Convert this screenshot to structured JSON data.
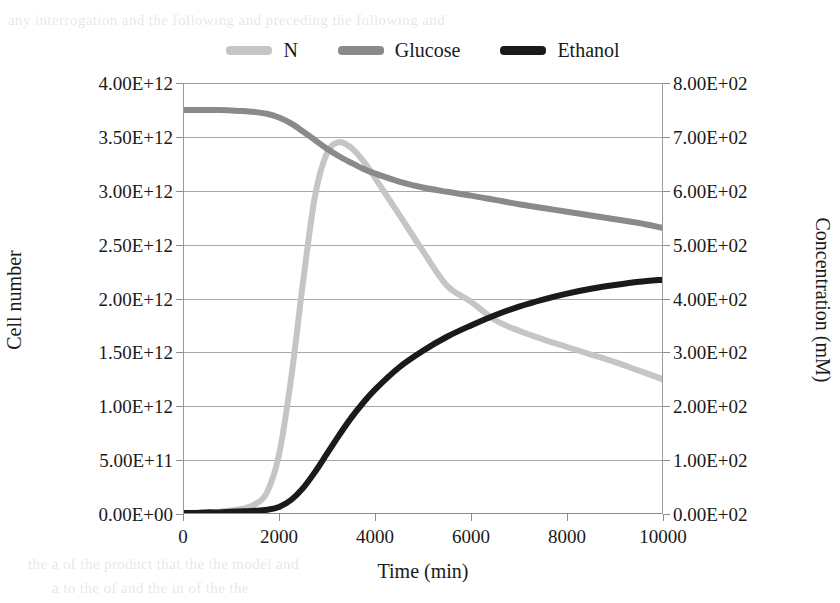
{
  "chart_data": {
    "type": "line",
    "title": "",
    "xlabel": "Time (min)",
    "ylabel": "Cell number",
    "y2label": "Concentration (mM)",
    "xlim": [
      0,
      10000
    ],
    "ylim": [
      0,
      4000000000000
    ],
    "y2lim": [
      0,
      800
    ],
    "grid": true,
    "legend_position": "top",
    "x_ticks": [
      "0",
      "2000",
      "4000",
      "6000",
      "8000",
      "10000"
    ],
    "x_tick_values": [
      0,
      2000,
      4000,
      6000,
      8000,
      10000
    ],
    "y_ticks": [
      "0.00E+00",
      "5.00E+11",
      "1.00E+12",
      "1.50E+12",
      "2.00E+12",
      "2.50E+12",
      "3.00E+12",
      "3.50E+12",
      "4.00E+12"
    ],
    "y_tick_values": [
      0,
      500000000000.0,
      1000000000000.0,
      1500000000000.0,
      2000000000000.0,
      2500000000000.0,
      3000000000000.0,
      3500000000000.0,
      4000000000000.0
    ],
    "y2_ticks": [
      "0.00E+02",
      "1.00E+02",
      "2.00E+02",
      "3.00E+02",
      "4.00E+02",
      "5.00E+02",
      "6.00E+02",
      "7.00E+02",
      "8.00E+02"
    ],
    "y2_tick_values": [
      0,
      100,
      200,
      300,
      400,
      500,
      600,
      700,
      800
    ],
    "x": [
      0,
      250,
      500,
      750,
      1000,
      1250,
      1500,
      1750,
      2000,
      2250,
      2500,
      2750,
      3000,
      3250,
      3500,
      3750,
      4000,
      4500,
      5000,
      5500,
      6000,
      6500,
      7000,
      7500,
      8000,
      8500,
      9000,
      9500,
      10000
    ],
    "series": [
      {
        "name": "N",
        "axis": "left",
        "color": "#c5c5c5",
        "units": "cells",
        "values": [
          10000000000.0,
          12000000000.0,
          16000000000.0,
          22000000000.0,
          32000000000.0,
          50000000000.0,
          90000000000.0,
          200000000000.0,
          550000000000.0,
          1250000000000.0,
          2150000000000.0,
          2950000000000.0,
          3350000000000.0,
          3450000000000.0,
          3400000000000.0,
          3280000000000.0,
          3120000000000.0,
          2780000000000.0,
          2440000000000.0,
          2120000000000.0,
          1970000000000.0,
          1800000000000.0,
          1700000000000.0,
          1620000000000.0,
          1550000000000.0,
          1480000000000.0,
          1410000000000.0,
          1330000000000.0,
          1250000000000.0
        ]
      },
      {
        "name": "Glucose",
        "axis": "right",
        "color": "#8a8a8a",
        "units": "mM",
        "values": [
          750,
          750,
          750,
          750,
          749,
          748,
          746,
          743,
          736,
          725,
          710,
          694,
          678,
          664,
          652,
          641,
          632,
          617,
          606,
          598,
          591,
          583,
          575,
          568,
          561,
          554,
          547,
          540,
          531
        ]
      },
      {
        "name": "Ethanol",
        "axis": "right",
        "color": "#1a1a1a",
        "units": "mM",
        "values": [
          2,
          2,
          3,
          3,
          4,
          5,
          6,
          8,
          13,
          26,
          48,
          78,
          112,
          146,
          178,
          206,
          231,
          272,
          303,
          329,
          350,
          369,
          385,
          398,
          409,
          418,
          425,
          431,
          435
        ]
      }
    ],
    "annotations": {
      "n_peak_time": 3250,
      "n_peak_value": 3450000000000.0,
      "glucose_initial": 750,
      "ethanol_final": 435
    }
  },
  "legend": {
    "items": [
      {
        "label": "N",
        "color": "#c5c5c5"
      },
      {
        "label": "Glucose",
        "color": "#8a8a8a"
      },
      {
        "label": "Ethanol",
        "color": "#1a1a1a"
      }
    ]
  },
  "axes": {
    "left_title": "Cell number",
    "right_title": "Concentration (mM)",
    "bottom_title": "Time (min)"
  },
  "page_showthrough": {
    "top": "any interrogation and the following and preceding the following and",
    "bottom_1": "the a of the product that the the model and",
    "bottom_2": "a to the of and the in of the the"
  }
}
